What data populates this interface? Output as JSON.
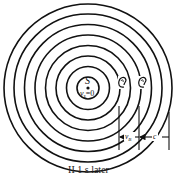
{
  "figure": {
    "source_label": "S",
    "source_velocity_label": "v",
    "source_velocity_sub": "s",
    "source_velocity_value": "=0",
    "observer_velocity_label": "v",
    "observer_velocity_sub": "B",
    "wave_speed_label": "c",
    "caption": "II 1 s later",
    "wavefront_count": 8,
    "colors": {
      "stroke": "#111111",
      "background": "#ffffff"
    }
  }
}
